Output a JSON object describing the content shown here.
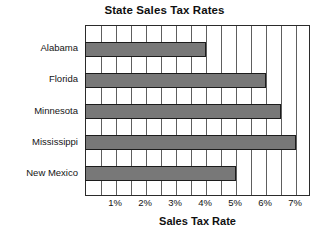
{
  "chart_data": {
    "type": "bar",
    "orientation": "horizontal",
    "title": "State Sales Tax Rates",
    "xlabel": "Sales Tax Rate",
    "ylabel": "",
    "categories": [
      "Alabama",
      "Florida",
      "Minnesota",
      "Mississippi",
      "New Mexico"
    ],
    "values": [
      4,
      6,
      6.5,
      7,
      5
    ],
    "value_unit": "%",
    "xlim": [
      0,
      7.5
    ],
    "xticks": [
      1,
      2,
      3,
      4,
      5,
      6,
      7
    ],
    "xtick_labels": [
      "1%",
      "2%",
      "3%",
      "4%",
      "5%",
      "6%",
      "7%"
    ],
    "gridline_interval": 0.5,
    "gridlines": [
      0.5,
      1,
      1.5,
      2,
      2.5,
      3,
      3.5,
      4,
      4.5,
      5,
      5.5,
      6,
      6.5,
      7
    ],
    "grid": true,
    "legend": false,
    "legend_position": "none",
    "bar_color": "#787878",
    "bar_border_color": "#1c1c1c",
    "axis_color": "#2b2b2b",
    "grid_color": "#5e5e5e",
    "background_color": "#ffffff",
    "series": [
      {
        "name": "Sales Tax Rate",
        "values": [
          4,
          6,
          6.5,
          7,
          5
        ]
      }
    ],
    "points": [
      {
        "category": "Alabama",
        "value": 4,
        "label": "4%"
      },
      {
        "category": "Florida",
        "value": 6,
        "label": "6%"
      },
      {
        "category": "Minnesota",
        "value": 6.5,
        "label": "6.5%"
      },
      {
        "category": "Mississippi",
        "value": 7,
        "label": "7%"
      },
      {
        "category": "New Mexico",
        "value": 5,
        "label": "5%"
      }
    ]
  }
}
